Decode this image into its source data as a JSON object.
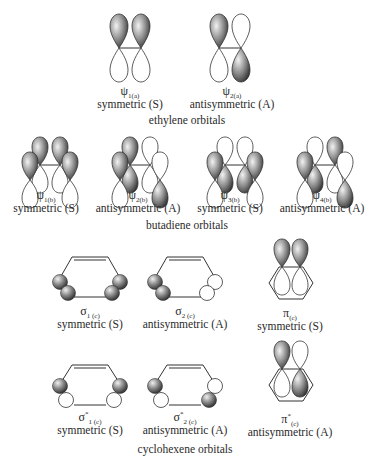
{
  "sections": {
    "ethylene": {
      "title": "ethylene orbitals",
      "orbitals": [
        {
          "symbol": "ψ",
          "subscript": "1(a)",
          "symmetry": "symmetric (S)"
        },
        {
          "symbol": "ψ",
          "subscript": "2(a)",
          "symmetry": "antisymmetric (A)"
        }
      ]
    },
    "butadiene": {
      "title": "butadiene orbitals",
      "orbitals": [
        {
          "symbol": "ψ",
          "subscript": "1(b)",
          "symmetry": "symmetric (S)"
        },
        {
          "symbol": "ψ",
          "subscript": "2(b)",
          "symmetry": "antisymmetric (A)"
        },
        {
          "symbol": "ψ",
          "subscript": "3(b)",
          "symmetry": "symmetric (S)"
        },
        {
          "symbol": "ψ",
          "subscript": "4(b)",
          "symmetry": "antisymmetric (A)"
        }
      ]
    },
    "cyclohexene": {
      "title": "cyclohexene orbitals",
      "orbitals": [
        {
          "symbol": "σ",
          "subscript": "1 (c)",
          "superscript": "",
          "symmetry": "symmetric (S)"
        },
        {
          "symbol": "σ",
          "subscript": "2 (c)",
          "superscript": "",
          "symmetry": "antisymmetric (A)"
        },
        {
          "symbol": "π",
          "subscript": "(c)",
          "superscript": "",
          "symmetry": "symmetric (S)"
        },
        {
          "symbol": "σ",
          "subscript": "1 (c)",
          "superscript": "*",
          "symmetry": "symmetric (S)"
        },
        {
          "symbol": "σ",
          "subscript": "2 (c)",
          "superscript": "*",
          "symmetry": "antisymmetric (A)"
        },
        {
          "symbol": "π",
          "subscript": "(c)",
          "superscript": "*",
          "symmetry": "antisymmetric (A)"
        }
      ]
    }
  },
  "colors": {
    "lobe_shaded": "#5a5a5a",
    "lobe_highlight": "#e8e8e8",
    "outline": "#333333",
    "background": "#ffffff"
  }
}
